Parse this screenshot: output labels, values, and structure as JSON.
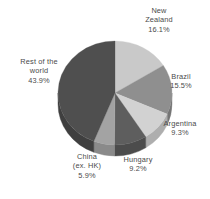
{
  "chart_data": {
    "type": "pie",
    "title": "",
    "subtitle": "",
    "xlabel": "",
    "ylabel": "",
    "legend_position": "none",
    "grid": false,
    "start_angle_deg": 0,
    "direction": "clockwise",
    "three_d": true,
    "categories": [
      "New Zealand",
      "Brazil",
      "Argentina",
      "Hungary",
      "China (ex. HK)",
      "Rest of the world"
    ],
    "values": [
      16.1,
      15.5,
      9.3,
      9.2,
      5.9,
      43.9
    ],
    "value_suffix": "%",
    "slices": [
      {
        "name": "New Zealand",
        "label_line1": "New",
        "label_line2": "Zealand",
        "value_text": "16.1%",
        "value": 16.1,
        "color": "#c9c9c9",
        "side_color": "#a8a8a8"
      },
      {
        "name": "Brazil",
        "label_line1": "Brazil",
        "label_line2": "",
        "value_text": "15.5%",
        "value": 15.5,
        "color": "#8f8f8f",
        "side_color": "#757575"
      },
      {
        "name": "Argentina",
        "label_line1": "Argentina",
        "label_line2": "",
        "value_text": "9.3%",
        "value": 9.3,
        "color": "#d2d2d2",
        "side_color": "#aeaeae"
      },
      {
        "name": "Hungary",
        "label_line1": "Hungary",
        "label_line2": "",
        "value_text": "9.2%",
        "value": 9.2,
        "color": "#5e5e5e",
        "side_color": "#4c4c4c"
      },
      {
        "name": "China (ex. HK)",
        "label_line1": "China",
        "label_line2": "(ex. HK)",
        "value_text": "5.9%",
        "value": 5.9,
        "color": "#a3a3a3",
        "side_color": "#8a8a8a"
      },
      {
        "name": "Rest of the world",
        "label_line1": "Rest of the",
        "label_line2": "world",
        "value_text": "43.9%",
        "value": 43.9,
        "color": "#4f4f4f",
        "side_color": "#3f3f3f"
      }
    ],
    "colors": {
      "background": "#ffffff",
      "label_text": "#4a4a4a",
      "accent_dark": "#4f4f4f",
      "accent_light": "#d2d2d2"
    }
  }
}
